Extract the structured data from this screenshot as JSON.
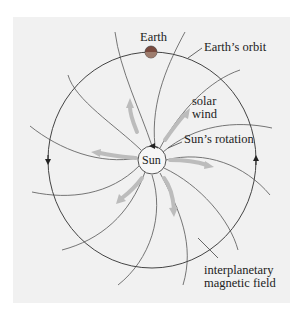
{
  "diagram": {
    "labels": {
      "earth": "Earth",
      "earth_orbit": "Earth’s orbit",
      "solar_wind_line1": "solar",
      "solar_wind_line2": "wind",
      "sun_rotation": "Sun’s rotation",
      "sun": "Sun",
      "imf_line1": "interplanetary",
      "imf_line2": "magnetic field"
    },
    "colors": {
      "background_panel": "#f1f1f1",
      "field_lines": "#555555",
      "solar_wind_arrows": "#b8b8b8",
      "earth": "#8a4a3a"
    },
    "elements": [
      "Sun",
      "Earth",
      "Earth's orbit (counter-clockwise arrows)",
      "spiral interplanetary magnetic field lines",
      "solar wind radial arrows",
      "Sun's rotation arrow"
    ]
  }
}
